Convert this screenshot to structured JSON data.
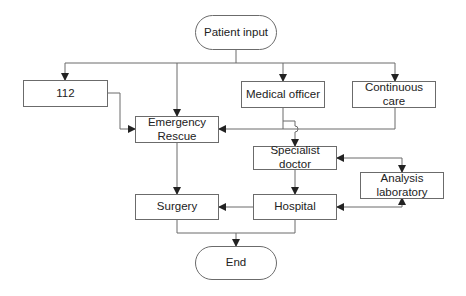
{
  "diagram": {
    "type": "flowchart",
    "nodes": {
      "patient_input": "Patient input",
      "n112": "112",
      "emergency_rescue": "Emergency Rescue",
      "medical_officer": "Medical officer",
      "continuous_care": "Continuous care",
      "specialist_doctor": "Specialist doctor",
      "analysis_laboratory": "Analysis laboratory",
      "surgery": "Surgery",
      "hospital": "Hospital",
      "end": "End"
    },
    "edges": [
      {
        "from": "Patient input",
        "to": "112"
      },
      {
        "from": "Patient input",
        "to": "Emergency Rescue"
      },
      {
        "from": "Patient input",
        "to": "Medical officer"
      },
      {
        "from": "Patient input",
        "to": "Continuous care"
      },
      {
        "from": "112",
        "to": "Emergency Rescue"
      },
      {
        "from": "Medical officer",
        "to": "Emergency Rescue"
      },
      {
        "from": "Medical officer",
        "to": "Specialist doctor"
      },
      {
        "from": "Continuous care",
        "to": "Emergency Rescue"
      },
      {
        "from": "Specialist doctor",
        "to": "Analysis laboratory",
        "bidirectional": true
      },
      {
        "from": "Hospital",
        "to": "Analysis laboratory",
        "bidirectional": true
      },
      {
        "from": "Specialist doctor",
        "to": "Hospital"
      },
      {
        "from": "Emergency Rescue",
        "to": "Surgery"
      },
      {
        "from": "Hospital",
        "to": "Surgery"
      },
      {
        "from": "Surgery",
        "to": "End"
      },
      {
        "from": "Hospital",
        "to": "End"
      }
    ],
    "colors": {
      "line": "#6b6b6b",
      "text": "#222222",
      "background": "#ffffff"
    }
  }
}
